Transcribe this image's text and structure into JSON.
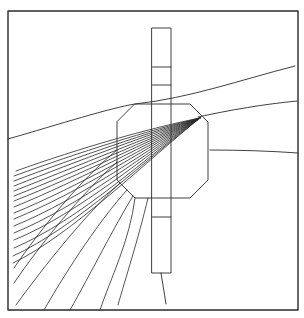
{
  "diagram": {
    "width": 304,
    "height": 318,
    "ink_color": "#2a2a2a",
    "background": "#ffffff",
    "frame": {
      "x1": 8,
      "y1": 11,
      "x2": 298,
      "y2": 310
    },
    "column": {
      "x": 152,
      "y": 28,
      "w": 19,
      "h": 245,
      "dividers_y": [
        67,
        85,
        217
      ],
      "tail": {
        "x1": 161,
        "y1": 273,
        "x2": 166,
        "y2": 304
      }
    },
    "octagon": {
      "points": "135,104 190,104 208,122 208,180 190,198 135,198 117,180 117,122"
    },
    "right_lines": [
      "M8,139 C60,124 110,108 135,104 C190,98 240,80 295,66",
      "M198,117 C230,110 265,104 297,101",
      "M210,150 C240,150 270,151 298,153"
    ],
    "fan_origin": {
      "x": 200,
      "y": 118
    },
    "fan_lines": [
      "M200,118 C150,128 80,148 16,171",
      "M200,118 C150,130 80,152 14,176",
      "M200,118 C150,132 80,156 14,181",
      "M200,118 C150,134 80,160 14,186",
      "M200,118 C150,136 80,165 14,191",
      "M200,118 C150,138 80,170 14,196",
      "M200,118 C150,140 80,175 14,201",
      "M200,118 C150,142 80,180 14,207",
      "M200,118 C150,144 80,186 14,213",
      "M200,118 C150,146 80,192 14,219",
      "M200,118 C150,148 80,199 14,226",
      "M200,118 C150,150 80,206 14,233",
      "M200,118 C150,152 80,213 14,240",
      "M200,118 C150,154 80,220 14,248",
      "M200,118 C150,156 75,228 13,256",
      "M200,118 C150,158 70,236 13,263",
      "M117,150 C80,180 40,230 14,268",
      "M117,162 C80,195 40,245 14,283",
      "M120,183 C85,215 45,265 16,305",
      "M127,190 C100,220 70,265 44,310",
      "M133,196 C115,225 90,275 70,310",
      "M135,198 C130,240 110,280 100,310",
      "M148,198 C138,240 125,280 118,305"
    ]
  }
}
